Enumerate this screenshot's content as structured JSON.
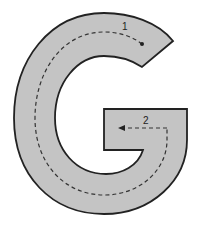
{
  "figure": {
    "letter": "G",
    "fill_color": "#c4c4c4",
    "stroke_color": "#222222",
    "path_color": "#333333",
    "strokes": [
      {
        "number": "1",
        "description": "start at dot, curve left and around down, then up right side"
      },
      {
        "number": "2",
        "description": "cross stroke moving left with arrow"
      }
    ]
  }
}
